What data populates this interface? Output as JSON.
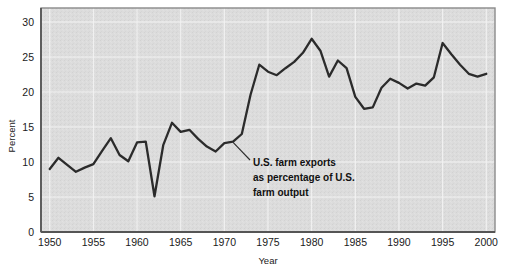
{
  "chart_data": {
    "type": "line",
    "title": "",
    "xlabel": "Year",
    "ylabel": "Percent",
    "xlim": [
      1949,
      2001
    ],
    "ylim": [
      0,
      32
    ],
    "grid": true,
    "legend": "none",
    "x_ticks": [
      "1950",
      "1955",
      "1960",
      "1965",
      "1970",
      "1975",
      "1980",
      "1985",
      "1990",
      "1995",
      "2000"
    ],
    "y_ticks": [
      "0",
      "5",
      "10",
      "15",
      "20",
      "25",
      "30"
    ],
    "annotations": [
      {
        "id": "series-callout",
        "lines": [
          "U.S. farm exports",
          "as percentage of U.S.",
          "farm output"
        ],
        "points_to_year": 1971,
        "points_to_value": 12.8
      }
    ],
    "series": [
      {
        "name": "U.S. farm exports as percentage of U.S. farm output",
        "color": "#2b2b2b",
        "x": [
          1950,
          1951,
          1952,
          1953,
          1954,
          1955,
          1956,
          1957,
          1958,
          1959,
          1960,
          1961,
          1962,
          1963,
          1964,
          1965,
          1966,
          1967,
          1968,
          1969,
          1970,
          1971,
          1972,
          1973,
          1974,
          1975,
          1976,
          1977,
          1978,
          1979,
          1980,
          1981,
          1982,
          1983,
          1984,
          1985,
          1986,
          1987,
          1988,
          1989,
          1990,
          1991,
          1992,
          1993,
          1994,
          1995,
          1996,
          1997,
          1998,
          1999,
          2000
        ],
        "y": [
          9.0,
          10.6,
          9.6,
          8.6,
          9.2,
          9.7,
          11.6,
          13.4,
          11.0,
          10.1,
          12.8,
          12.9,
          5.1,
          12.4,
          15.6,
          14.3,
          14.6,
          13.3,
          12.2,
          11.5,
          12.7,
          12.9,
          14.0,
          19.6,
          23.9,
          22.9,
          22.4,
          23.4,
          24.3,
          25.6,
          27.6,
          25.9,
          22.2,
          24.5,
          23.4,
          19.3,
          17.6,
          17.8,
          20.6,
          21.9,
          21.3,
          20.5,
          21.2,
          20.9,
          22.1,
          27.0,
          25.4,
          23.9,
          22.6,
          22.2,
          22.6
        ]
      }
    ]
  },
  "axis": {
    "y_label": "Percent",
    "x_label": "Year"
  },
  "colors": {
    "plot_background": "#dcdcdc",
    "line": "#2b2b2b",
    "gridline": "#f2f2f2",
    "border": "#8a8a8a",
    "text": "#1a1a1a"
  }
}
